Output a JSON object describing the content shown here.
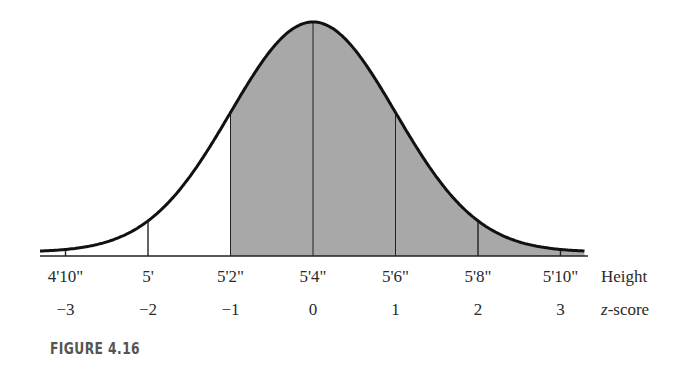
{
  "chart_data": {
    "type": "area",
    "title": "",
    "caption": "FIGURE 4.16",
    "xlabel": "Height",
    "x2label": "z-score",
    "ylabel": "",
    "height_ticks": [
      "4'10\"",
      "5'",
      "5'2\"",
      "5'4\"",
      "5'6\"",
      "5'8\"",
      "5'10\""
    ],
    "z_ticks": [
      "−3",
      "−2",
      "−1",
      "0",
      "1",
      "2",
      "3"
    ],
    "z_values": [
      -3,
      -2,
      -1,
      0,
      1,
      2,
      3
    ],
    "mean": "5'4\"",
    "std_dev_inches": 2,
    "shaded_region": {
      "from_z": -1,
      "to_z": "infinity"
    },
    "vertical_lines_at_z": [
      -3,
      -2,
      -1,
      0,
      1,
      2,
      3
    ],
    "colors": {
      "curve": "#111111",
      "shade": "#a8a8a8",
      "axis": "#222222"
    }
  },
  "labels": {
    "height_axis": "Height",
    "z_axis_italic": "z",
    "z_axis_rest": "-score",
    "figure": "FIGURE 4.16"
  }
}
